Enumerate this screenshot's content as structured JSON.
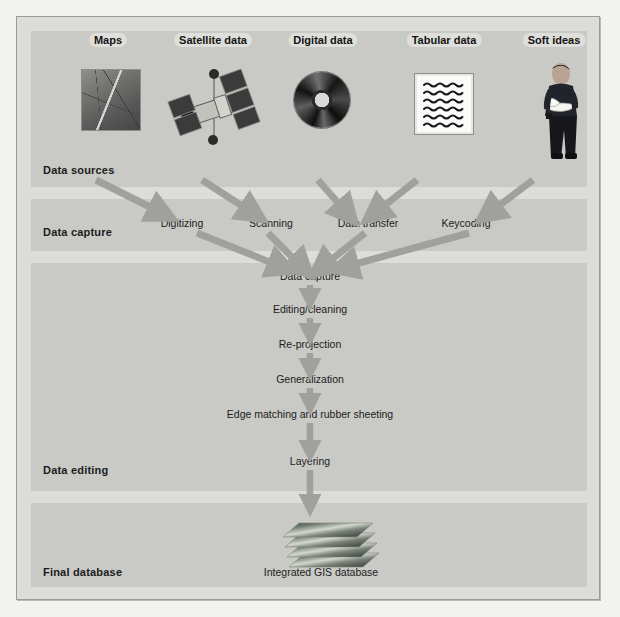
{
  "diagram": {
    "band_color": "#c9c9c5",
    "panel_color": "#dcdcd8",
    "arrow_color": "#9d9d99"
  },
  "rows": [
    {
      "key": "sources",
      "label": "Data sources"
    },
    {
      "key": "capture",
      "label": "Data capture"
    },
    {
      "key": "editing",
      "label": "Data editing"
    },
    {
      "key": "final",
      "label": "Final database"
    }
  ],
  "sources": [
    {
      "label": "Maps",
      "icon": "map-thumbnail-icon"
    },
    {
      "label": "Satellite data",
      "icon": "satellite-icon"
    },
    {
      "label": "Digital data",
      "icon": "compact-disc-icon"
    },
    {
      "label": "Tabular data",
      "icon": "document-lines-icon"
    },
    {
      "label": "Soft ideas",
      "icon": "person-reading-icon"
    }
  ],
  "capture_methods": [
    {
      "label": "Digitizing"
    },
    {
      "label": "Scanning"
    },
    {
      "label": "Data transfer"
    },
    {
      "label": "Keycoding"
    }
  ],
  "pipeline": [
    {
      "label": "Data capture"
    },
    {
      "label": "Editing/cleaning"
    },
    {
      "label": "Re-projection"
    },
    {
      "label": "Generalization"
    },
    {
      "label": "Edge matching and rubber sheeting"
    },
    {
      "label": "Layering"
    }
  ],
  "final": {
    "label": "Integrated GIS database",
    "icon": "stacked-layers-icon"
  }
}
